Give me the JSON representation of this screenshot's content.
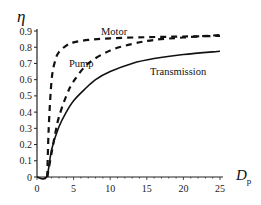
{
  "chart_data": {
    "type": "line",
    "title": "",
    "xlabel": "D",
    "xlabel_subscript": "p",
    "ylabel": "η",
    "xlim": [
      0,
      25
    ],
    "ylim": [
      0,
      0.9
    ],
    "x_ticks": [
      0,
      5,
      10,
      15,
      20,
      25
    ],
    "y_ticks": [
      0,
      0.1,
      0.2,
      0.3,
      0.4,
      0.5,
      0.6,
      0.7,
      0.8,
      0.9
    ],
    "grid": false,
    "legend": "inline labels",
    "series": [
      {
        "name": "Motor",
        "style": "dashed",
        "x": [
          1.4,
          1.6,
          2,
          2.5,
          3,
          4,
          5,
          7,
          10,
          15,
          20,
          25
        ],
        "y": [
          0,
          0.3,
          0.6,
          0.72,
          0.77,
          0.81,
          0.83,
          0.845,
          0.855,
          0.862,
          0.866,
          0.87
        ]
      },
      {
        "name": "Pump",
        "style": "dashed",
        "x": [
          1.4,
          2,
          2.5,
          3,
          4,
          5,
          7,
          10,
          13,
          16,
          20,
          25
        ],
        "y": [
          0,
          0.15,
          0.27,
          0.37,
          0.5,
          0.59,
          0.7,
          0.78,
          0.82,
          0.845,
          0.86,
          0.875
        ]
      },
      {
        "name": "Transmission",
        "style": "solid",
        "x": [
          0,
          1.3,
          2,
          3,
          4,
          5,
          6.5,
          8,
          10,
          13,
          16,
          20,
          25
        ],
        "y": [
          0,
          0,
          0.17,
          0.31,
          0.4,
          0.47,
          0.54,
          0.6,
          0.65,
          0.7,
          0.73,
          0.755,
          0.775
        ]
      }
    ]
  },
  "labels": {
    "y_axis_symbol": "η",
    "x_axis_symbol": "D",
    "x_axis_subscript": "p",
    "motor": "Motor",
    "pump": "Pump",
    "transmission": "Transmission"
  }
}
